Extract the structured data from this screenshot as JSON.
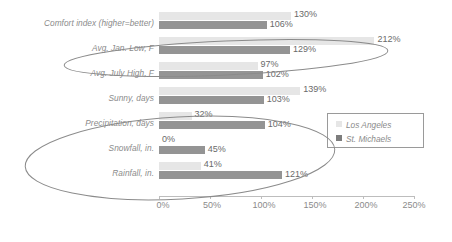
{
  "chart_data": {
    "type": "bar",
    "orientation": "horizontal",
    "title": "",
    "xlabel": "",
    "ylabel": "",
    "xlim": [
      0,
      250
    ],
    "xticks": [
      "0%",
      "50%",
      "100%",
      "150%",
      "200%",
      "250%"
    ],
    "xtick_values": [
      0,
      50,
      100,
      150,
      200,
      250
    ],
    "grid": false,
    "legend_position": "middle-right",
    "categories": [
      "Comfort index (higher=better)",
      "Avg. Jan. Low, F",
      "Avg. July High, F",
      "Sunny, days",
      "Precipitation, days",
      "Snowfall, in.",
      "Rainfall, in."
    ],
    "series": [
      {
        "name": "Los Angeles",
        "color": "#e6e6e6",
        "values": [
          130,
          212,
          97,
          139,
          32,
          0,
          41
        ],
        "labels": [
          "130%",
          "212%",
          "97%",
          "139%",
          "32%",
          "0%",
          "41%"
        ]
      },
      {
        "name": "St. Michaels",
        "color": "#949494",
        "values": [
          106,
          129,
          102,
          103,
          104,
          45,
          121
        ],
        "labels": [
          "106%",
          "129%",
          "102%",
          "103%",
          "104%",
          "45%",
          "121%"
        ]
      }
    ],
    "annotations": [
      {
        "type": "ellipse",
        "name": "highlight-ellipse-top",
        "encircles": [
          "Avg. Jan. Low, F"
        ],
        "color": "#8b8b8b"
      },
      {
        "type": "ellipse",
        "name": "highlight-ellipse-bottom",
        "encircles": [
          "Precipitation, days",
          "Snowfall, in.",
          "Rainfall, in."
        ],
        "color": "#8b8b8b"
      }
    ]
  }
}
